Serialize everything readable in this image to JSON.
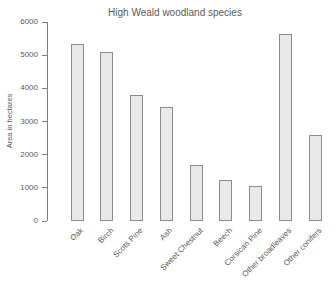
{
  "chart_data": {
    "type": "bar",
    "title": "High Weald woodland species",
    "xlabel": "",
    "ylabel": "Area in hectares",
    "categories": [
      "Oak",
      "Birch",
      "Scots Pine",
      "Ash",
      "Sweet Chestnut",
      "Beech",
      "Corsican Pine",
      "Other broadleaves",
      "Other conifers"
    ],
    "values": [
      5350,
      5100,
      3800,
      3450,
      1700,
      1250,
      1050,
      5650,
      2600
    ],
    "ylim": [
      0,
      6000
    ],
    "yticks": [
      0,
      1000,
      2000,
      3000,
      4000,
      5000,
      6000
    ],
    "grid": false,
    "legend": false,
    "colors": {
      "bar_fill": "#e9e9e9",
      "bar_border": "#8c8c8c",
      "axis": "#7f7f7f",
      "text": "#595959"
    }
  }
}
